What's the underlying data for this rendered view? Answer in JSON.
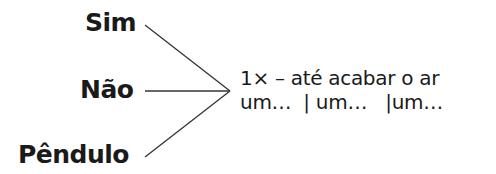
{
  "options": [
    {
      "label": "Sim"
    },
    {
      "label": "Não"
    },
    {
      "label": "Pêndulo"
    }
  ],
  "target": {
    "line1": "1× – até acabar o ar",
    "line2": "um…  | um…   |um…"
  }
}
